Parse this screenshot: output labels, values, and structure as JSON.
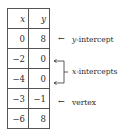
{
  "table": {
    "headers": [
      "x",
      "y"
    ],
    "rows": [
      [
        "0",
        "8"
      ],
      [
        "−2",
        "0"
      ],
      [
        "−4",
        "0"
      ],
      [
        "−3",
        "−1"
      ],
      [
        "−6",
        "8"
      ]
    ]
  },
  "annotations": {
    "y_intercept": {
      "var": "y",
      "text": "-intercept"
    },
    "x_intercepts": {
      "var": "x",
      "text": "-intercepts"
    },
    "vertex": {
      "text": "vertex"
    },
    "arrow": "←"
  }
}
